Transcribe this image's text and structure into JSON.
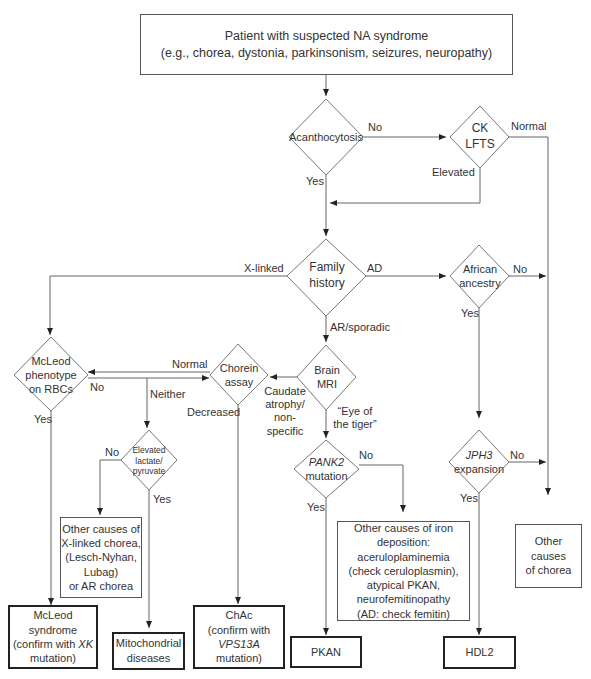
{
  "diagram": {
    "type": "clinical-decision-flowchart",
    "start": {
      "line1": "Patient with suspected NA syndrome",
      "line2": "(e.g., chorea, dystonia, parkinsonism, seizures, neuropathy)"
    },
    "decisions": {
      "acanthocytosis": "Acanthocytosis",
      "ck_lfts": {
        "line1": "CK",
        "line2": "LFTS"
      },
      "family_history": {
        "line1": "Family",
        "line2": "history"
      },
      "african_ancestry": {
        "line1": "African",
        "line2": "ancestry"
      },
      "mcleod_phenotype": {
        "line1": "McLeod",
        "line2": "phenotype",
        "line3": "on RBCs"
      },
      "chorein_assay": {
        "line1": "Chorein",
        "line2": "assay"
      },
      "brain_mri": {
        "line1": "Brain",
        "line2": "MRI"
      },
      "elevated_lactate": {
        "line1": "Elevated",
        "line2": "lactate/",
        "line3": "pyruvate"
      },
      "pank2": {
        "gene": "PANK2",
        "line2": "mutation"
      },
      "jph3": {
        "gene": "JPH3",
        "line2": "expansion"
      }
    },
    "edge_labels": {
      "acanth_no": "No",
      "acanth_yes": "Yes",
      "ck_normal": "Normal",
      "ck_elevated": "Elevated",
      "fh_xlinked": "X-linked",
      "fh_ad": "AD",
      "fh_ar": "AR/sporadic",
      "african_no": "No",
      "african_yes": "Yes",
      "mcleod_no": "No",
      "mcleod_yes": "Yes",
      "chorein_normal": "Normal",
      "chorein_neither": "Neither",
      "chorein_decreased": "Decreased",
      "mri_caudate": "Caudate atrophy/ non-specific",
      "mri_eye": "“Eye of the tiger”",
      "lactate_no": "No",
      "lactate_yes": "Yes",
      "pank2_no": "No",
      "pank2_yes": "Yes",
      "jph3_no": "No",
      "jph3_yes": "Yes"
    },
    "intermediate_boxes": {
      "other_xlinked": [
        "Other causes of",
        "X-linked chorea,",
        "(Lesch-Nyhan,",
        "Lubag)",
        "or AR chorea"
      ],
      "other_iron": [
        "Other causes of iron",
        "deposition:",
        "aceruloplaminemia",
        "(check ceruloplasmin),",
        "atypical PKAN,",
        "neurofemitinopathy",
        "(AD: check femitin)"
      ],
      "other_chorea": [
        "Other causes",
        "of chorea"
      ]
    },
    "outcomes": {
      "mcleod": {
        "line1": "McLeod",
        "line2": "syndrome",
        "line3_pre": "(confirm with ",
        "gene": "XK",
        "line4": "mutation)"
      },
      "mitochondrial": {
        "line1": "Mitochondrial",
        "line2": "diseases"
      },
      "chac": {
        "line1": "ChAc",
        "line2": "(confirm with",
        "gene": "VPS13A",
        "line4": "mutation)"
      },
      "pkan": "PKAN",
      "hdl2": "HDL2"
    }
  }
}
